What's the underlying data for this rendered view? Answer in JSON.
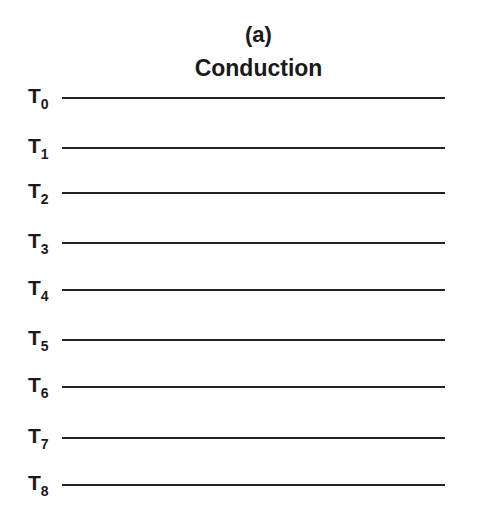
{
  "figure": {
    "panel_label": "(a)",
    "title": "Conduction"
  },
  "levels": [
    {
      "label": "T",
      "sub": "0",
      "y": 97
    },
    {
      "label": "T",
      "sub": "1",
      "y": 147
    },
    {
      "label": "T",
      "sub": "2",
      "y": 192
    },
    {
      "label": "T",
      "sub": "3",
      "y": 242
    },
    {
      "label": "T",
      "sub": "4",
      "y": 289
    },
    {
      "label": "T",
      "sub": "5",
      "y": 339
    },
    {
      "label": "T",
      "sub": "6",
      "y": 386
    },
    {
      "label": "T",
      "sub": "7",
      "y": 437
    },
    {
      "label": "T",
      "sub": "8",
      "y": 484
    }
  ],
  "colors": {
    "line": "#222222",
    "text": "#1a1a1a",
    "background": "#ffffff"
  }
}
